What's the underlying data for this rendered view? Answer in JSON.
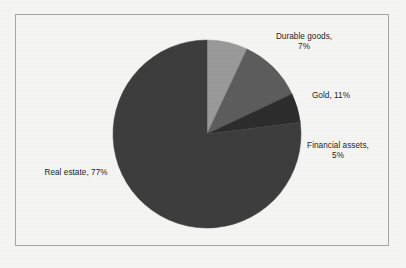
{
  "figure": {
    "background_color": "#f6f6f4",
    "border_color": "#a7a7a5"
  },
  "chart_data": {
    "type": "pie",
    "title": "",
    "subtitle": "",
    "xlabel": "",
    "ylabel": "",
    "legend_position": "none",
    "grid": false,
    "labels_show_category_and_percent": true,
    "start_angle_deg": 0,
    "direction": "clockwise",
    "categories": [
      "Durable goods",
      "Gold",
      "Financial assets",
      "Real estate"
    ],
    "values": [
      7,
      11,
      5,
      77
    ],
    "units": "percent",
    "colors": [
      "#9a9a9a",
      "#5c5c5c",
      "#2b2b2b",
      "#3c3c3c"
    ],
    "slices": [
      {
        "name": "Durable goods",
        "value": 7,
        "percent_text": "7%",
        "color": "#9a9a9a",
        "label_line_1": "Durable goods,",
        "label_line_2": "7%"
      },
      {
        "name": "Gold",
        "value": 11,
        "percent_text": "11%",
        "color": "#5c5c5c",
        "label_line_1": "Gold, 11%",
        "label_line_2": ""
      },
      {
        "name": "Financial assets",
        "value": 5,
        "percent_text": "5%",
        "color": "#2b2b2b",
        "label_line_1": "Financial assets,",
        "label_line_2": "5%"
      },
      {
        "name": "Real estate",
        "value": 77,
        "percent_text": "77%",
        "color": "#3c3c3c",
        "label_line_1": "Real estate, 77%",
        "label_line_2": ""
      }
    ],
    "data_labels": [
      "Durable goods,\n7%",
      "Gold, 11%",
      "Financial assets,\n5%",
      "Real estate, 77%"
    ]
  }
}
